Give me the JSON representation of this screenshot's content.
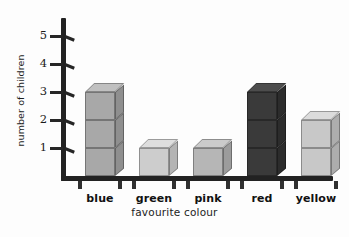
{
  "chart_data": {
    "type": "bar",
    "title": "",
    "subtitle": "",
    "xlabel": "favourite colour",
    "ylabel": "number of children",
    "categories": [
      "blue",
      "green",
      "pink",
      "red",
      "yellow"
    ],
    "values": [
      3,
      1,
      1,
      3,
      2
    ],
    "ylim": [
      0,
      5
    ],
    "ytick_labels": [
      "1",
      "2",
      "3",
      "4",
      "5"
    ],
    "ytick_values": [
      1,
      2,
      3,
      4,
      5
    ],
    "grid": false,
    "legend": false,
    "legend_position": "none",
    "style": "photographed stacked unit cubes on hand-drawn axes",
    "bar_colors": [
      "#a8a8a8",
      "#cdcdcd",
      "#b6b6b6",
      "#3a3a3a",
      "#c8c8c8"
    ],
    "bar_top_colors": [
      "#c0c0c0",
      "#dedede",
      "#cbcbcb",
      "#4d4d4d",
      "#dcdcdc"
    ],
    "bar_side_colors": [
      "#8f8f8f",
      "#b4b4b4",
      "#9c9c9c",
      "#2c2c2c",
      "#adadad"
    ],
    "axis_color": "#222222",
    "background_color": "#fdfdfd",
    "text_color": "#1a1a1a"
  },
  "axes": {
    "y_title": "number of children",
    "x_title": "favourite colour"
  }
}
